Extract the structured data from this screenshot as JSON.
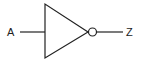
{
  "diagram": {
    "type": "logic-gate",
    "gate": "NOT (inverter)",
    "input_label": "A",
    "output_label": "Z",
    "stroke_color": "#222222",
    "background": "#ffffff"
  }
}
